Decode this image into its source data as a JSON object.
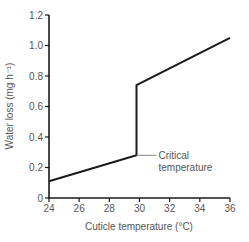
{
  "chart_data": {
    "type": "line",
    "title": "",
    "xlabel": "Cuticle temperature (°C)",
    "ylabel": "Water loss (mg h⁻¹)",
    "xlim": [
      24,
      36
    ],
    "ylim": [
      0,
      1.2
    ],
    "x_ticks": [
      "24",
      "26",
      "28",
      "30",
      "32",
      "34",
      "36"
    ],
    "y_ticks": [
      "0",
      "0.2",
      "0.4",
      "0.6",
      "0.8",
      "1.0",
      "1.2"
    ],
    "grid": false,
    "legend": null,
    "series": [
      {
        "name": "Water loss",
        "points": [
          {
            "x": 24,
            "y": 0.11
          },
          {
            "x": 29.8,
            "y": 0.28
          },
          {
            "x": 29.8,
            "y": 0.74
          },
          {
            "x": 36,
            "y": 1.05
          }
        ]
      }
    ],
    "annotations": [
      {
        "text": "Critical temperature",
        "line1": "Critical",
        "line2": "temperature",
        "x": 29.8,
        "y": 0.28
      }
    ]
  },
  "colors": {
    "line": "#1a1a1a",
    "axis": "#1a1a1a",
    "text": "#555555",
    "leader": "#888888"
  }
}
